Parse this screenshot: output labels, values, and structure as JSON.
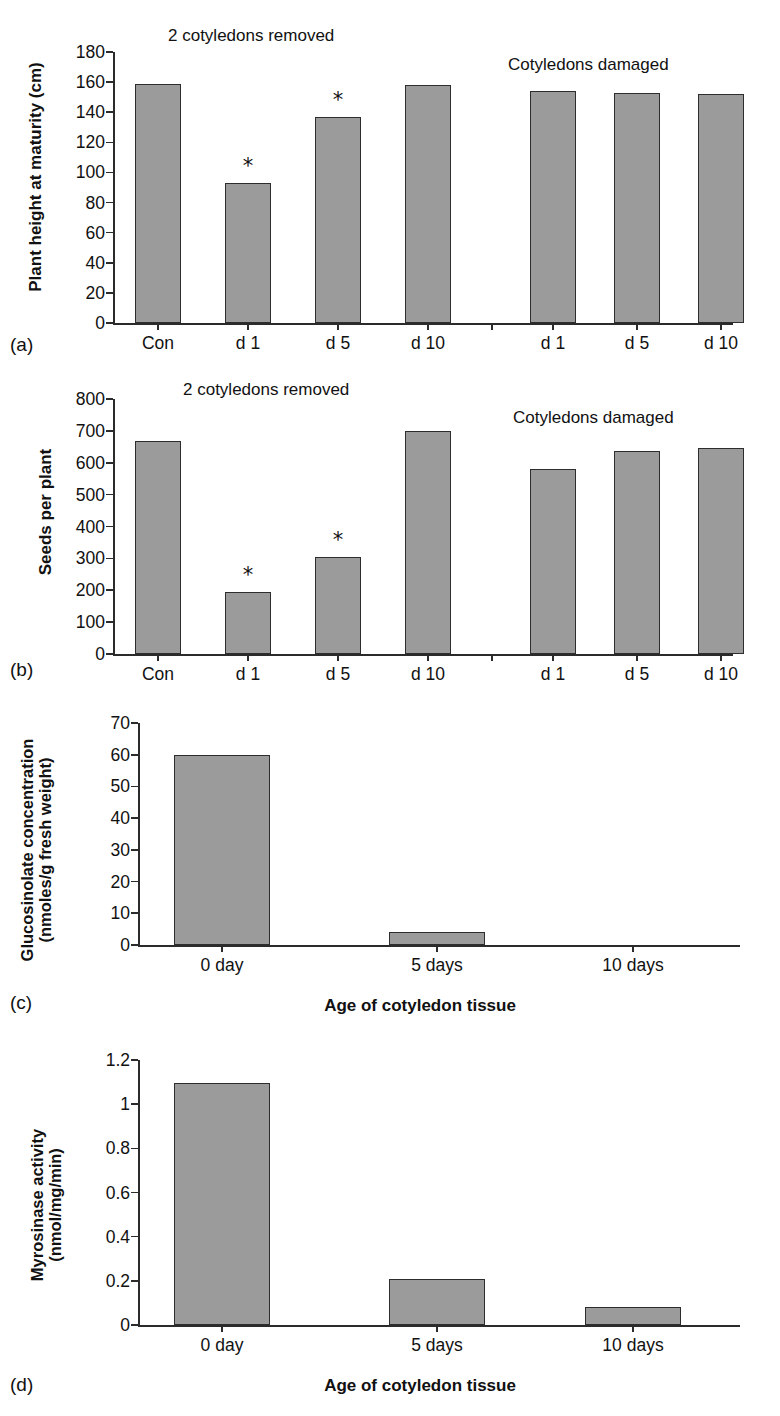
{
  "figure": {
    "bar_fill_color": "#9b9b9b",
    "bar_stroke_color": "#2d2d2d",
    "axis_color": "#2b2b2b",
    "significance_marker": "*"
  },
  "panels": [
    {
      "letter": "(a)",
      "ylabel": "Plant height at maturity (cm)",
      "group_titles": [
        "2 cotyledons removed",
        "Cotyledons damaged"
      ]
    },
    {
      "letter": "(b)",
      "ylabel": "Seeds per plant",
      "group_titles": [
        "2 cotyledons removed",
        "Cotyledons damaged"
      ]
    },
    {
      "letter": "(c)",
      "ylabel_line1": "Glucosinolate concentration",
      "ylabel_line2": "(nmoles/g fresh weight)",
      "xlabel": "Age of cotyledon tissue"
    },
    {
      "letter": "(d)",
      "ylabel_line1": "Myrosinase activity",
      "ylabel_line2": "(nmol/mg/min)",
      "xlabel": "Age of cotyledon tissue"
    }
  ],
  "chart_data": [
    {
      "panel": "(a)",
      "type": "bar",
      "title": "",
      "xlabel": "",
      "ylabel": "Plant height at maturity (cm)",
      "ylim": [
        0,
        180
      ],
      "yticks": [
        0,
        20,
        40,
        60,
        80,
        100,
        120,
        140,
        160,
        180
      ],
      "grid": false,
      "legend": "none",
      "annotations": [
        "2 cotyledons removed",
        "Cotyledons damaged"
      ],
      "groups": [
        {
          "name": "2 cotyledons removed",
          "categories": [
            "Con",
            "d 1",
            "d 5",
            "d 10"
          ],
          "values": [
            159,
            93,
            137,
            158
          ],
          "significant": [
            false,
            true,
            true,
            false
          ]
        },
        {
          "name": "Cotyledons damaged",
          "categories": [
            "d 1",
            "d 5",
            "d 10"
          ],
          "values": [
            154,
            153,
            152
          ],
          "significant": [
            false,
            false,
            false
          ]
        }
      ]
    },
    {
      "panel": "(b)",
      "type": "bar",
      "title": "",
      "xlabel": "",
      "ylabel": "Seeds per plant",
      "ylim": [
        0,
        800
      ],
      "yticks": [
        0,
        100,
        200,
        300,
        400,
        500,
        600,
        700,
        800
      ],
      "grid": false,
      "legend": "none",
      "annotations": [
        "2 cotyledons removed",
        "Cotyledons damaged"
      ],
      "groups": [
        {
          "name": "2 cotyledons removed",
          "categories": [
            "Con",
            "d 1",
            "d 5",
            "d 10"
          ],
          "values": [
            668,
            193,
            304,
            699
          ],
          "significant": [
            false,
            true,
            true,
            false
          ]
        },
        {
          "name": "Cotyledons damaged",
          "categories": [
            "d 1",
            "d 5",
            "d 10"
          ],
          "values": [
            580,
            638,
            645
          ],
          "significant": [
            false,
            false,
            false
          ]
        }
      ]
    },
    {
      "panel": "(c)",
      "type": "bar",
      "title": "",
      "xlabel": "Age of cotyledon tissue",
      "ylabel": "Glucosinolate concentration (nmoles/g fresh weight)",
      "ylim": [
        0,
        70
      ],
      "yticks": [
        0,
        10,
        20,
        30,
        40,
        50,
        60,
        70
      ],
      "grid": false,
      "legend": "none",
      "categories": [
        "0 day",
        "5 days",
        "10 days"
      ],
      "values": [
        59.8,
        4.1,
        0
      ]
    },
    {
      "panel": "(d)",
      "type": "bar",
      "title": "",
      "xlabel": "Age of cotyledon tissue",
      "ylabel": "Myrosinase activity (nmol/mg/min)",
      "ylim": [
        0,
        1.2
      ],
      "yticks": [
        0,
        0.2,
        0.4,
        0.6,
        0.8,
        1,
        1.2
      ],
      "ytick_labels": [
        "0",
        "0.2",
        "0.4",
        "0.6",
        "0.8",
        "1",
        "1.2"
      ],
      "grid": false,
      "legend": "none",
      "categories": [
        "0 day",
        "5 days",
        "10 days"
      ],
      "values": [
        1.095,
        0.21,
        0.08
      ]
    }
  ]
}
